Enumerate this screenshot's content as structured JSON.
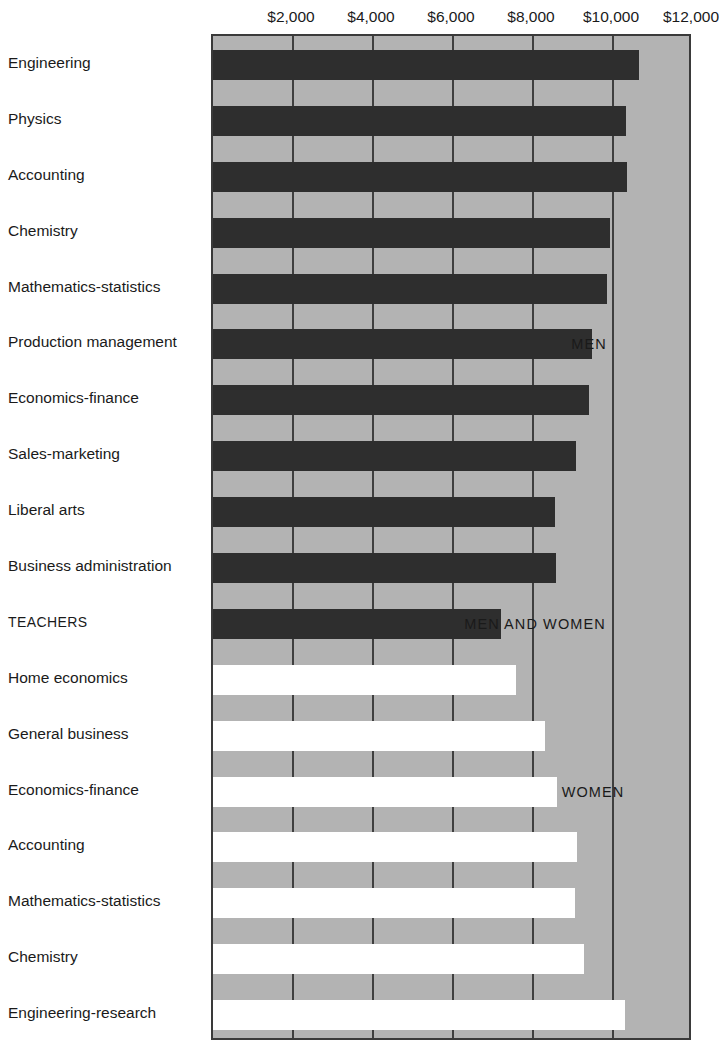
{
  "scan": {
    "remnant_text": ""
  },
  "chart_data": {
    "type": "bar",
    "orientation": "horizontal",
    "title": "",
    "subtitle": "",
    "xlabel": "",
    "ylabel": "",
    "xlim": [
      0,
      12000
    ],
    "grid": true,
    "gridlines": [
      2000,
      4000,
      6000,
      8000,
      10000,
      12000
    ],
    "tick_labels": [
      "$2,000",
      "$4,000",
      "$6,000",
      "$8,000",
      "$10,000",
      "$12,000"
    ],
    "tick_values": [
      2000,
      4000,
      6000,
      8000,
      10000,
      12000
    ],
    "legend_position": "in-plot-right",
    "series": [
      {
        "name": "MEN",
        "color": "#2e2e2e"
      },
      {
        "name": "MEN AND WOMEN",
        "color": "#2e2e2e"
      },
      {
        "name": "WOMEN",
        "color": "#ffffff"
      }
    ],
    "annotations": [
      {
        "text": "MEN",
        "x": 9400,
        "row": 5
      },
      {
        "text": "MEN AND WOMEN",
        "x": 8050,
        "row": 10
      },
      {
        "text": "WOMEN",
        "x": 9500,
        "row": 13
      }
    ],
    "categories": [
      "Engineering",
      "Physics",
      "Accounting",
      "Chemistry",
      "Mathematics-statistics",
      "Production management",
      "Economics-finance",
      "Sales-marketing",
      "Liberal arts",
      "Business administration",
      "TEACHERS",
      "Home economics",
      "General business",
      "Economics-finance",
      "Accounting",
      "Mathematics-statistics",
      "Chemistry",
      "Engineering-research"
    ],
    "values": [
      10650,
      10325,
      10350,
      9925,
      9850,
      9475,
      9400,
      9075,
      8550,
      8575,
      7200,
      7575,
      8300,
      8600,
      9100,
      9050,
      9275,
      10300
    ],
    "bars": [
      {
        "label": "Engineering",
        "value": 10650,
        "group": "MEN",
        "fill": "#2e2e2e"
      },
      {
        "label": "Physics",
        "value": 10325,
        "group": "MEN",
        "fill": "#2e2e2e"
      },
      {
        "label": "Accounting",
        "value": 10350,
        "group": "MEN",
        "fill": "#2e2e2e"
      },
      {
        "label": "Chemistry",
        "value": 9925,
        "group": "MEN",
        "fill": "#2e2e2e"
      },
      {
        "label": "Mathematics-statistics",
        "value": 9850,
        "group": "MEN",
        "fill": "#2e2e2e"
      },
      {
        "label": "Production management",
        "value": 9475,
        "group": "MEN",
        "fill": "#2e2e2e"
      },
      {
        "label": "Economics-finance",
        "value": 9400,
        "group": "MEN",
        "fill": "#2e2e2e"
      },
      {
        "label": "Sales-marketing",
        "value": 9075,
        "group": "MEN",
        "fill": "#2e2e2e"
      },
      {
        "label": "Liberal arts",
        "value": 8550,
        "group": "MEN",
        "fill": "#2e2e2e"
      },
      {
        "label": "Business administration",
        "value": 8575,
        "group": "MEN",
        "fill": "#2e2e2e"
      },
      {
        "label": "TEACHERS",
        "value": 7200,
        "group": "MEN AND WOMEN",
        "fill": "#2e2e2e"
      },
      {
        "label": "Home economics",
        "value": 7575,
        "group": "WOMEN",
        "fill": "#ffffff"
      },
      {
        "label": "General business",
        "value": 8300,
        "group": "WOMEN",
        "fill": "#ffffff"
      },
      {
        "label": "Economics-finance",
        "value": 8600,
        "group": "WOMEN",
        "fill": "#ffffff"
      },
      {
        "label": "Accounting",
        "value": 9100,
        "group": "WOMEN",
        "fill": "#ffffff"
      },
      {
        "label": "Mathematics-statistics",
        "value": 9050,
        "group": "WOMEN",
        "fill": "#ffffff"
      },
      {
        "label": "Chemistry",
        "value": 9275,
        "group": "WOMEN",
        "fill": "#ffffff"
      },
      {
        "label": "Engineering-research",
        "value": 10300,
        "group": "WOMEN",
        "fill": "#ffffff"
      }
    ]
  },
  "colors": {
    "plot_background": "#b3b3b3",
    "plot_border": "#3a3a3a",
    "gridline": "#3f3f3f",
    "men_bar": "#2e2e2e",
    "women_bar": "#ffffff",
    "page_background": "#ffffff",
    "text": "#1a1a1a"
  }
}
